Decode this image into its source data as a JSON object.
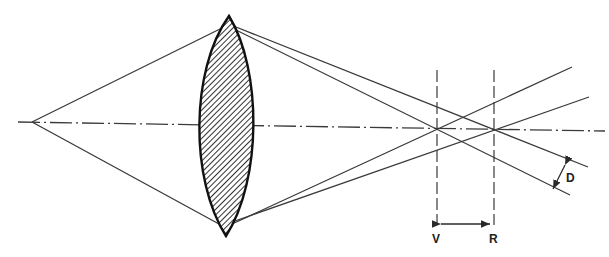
{
  "figure": {
    "labels": {
      "v": "V",
      "r": "R",
      "d": "D"
    },
    "colors": {
      "line": "#3a3a3a",
      "lens_outline": "#111111",
      "background": "#ffffff"
    }
  }
}
